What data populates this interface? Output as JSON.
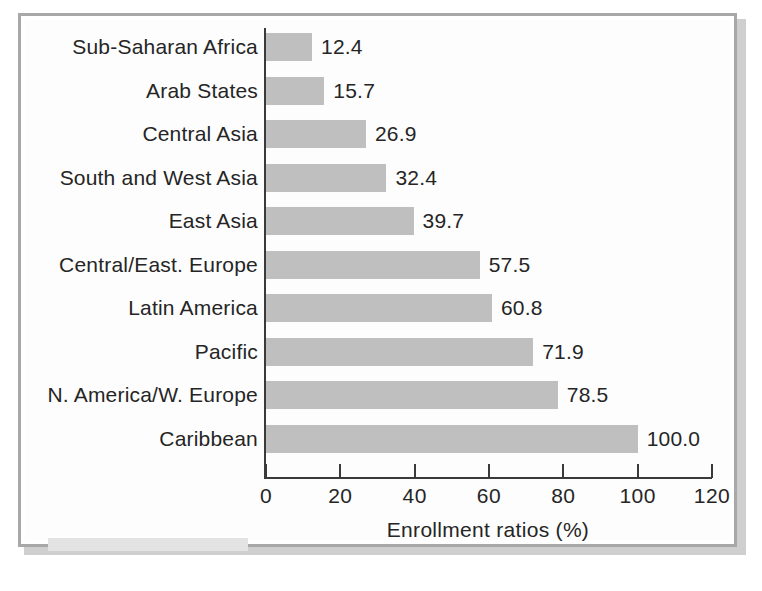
{
  "figure": {
    "frame_color": "#a8a8a8",
    "bar_color": "#bfbfbf",
    "text_color": "#252525"
  },
  "chart_data": {
    "type": "bar",
    "orientation": "horizontal",
    "title": "",
    "subtitle": "",
    "xlabel": "Enrollment ratios (%)",
    "ylabel": "",
    "xlim": [
      0,
      120
    ],
    "xticks": [
      0,
      20,
      40,
      60,
      80,
      100,
      120
    ],
    "xtick_labels": [
      "0",
      "20",
      "40",
      "60",
      "80",
      "100",
      "120"
    ],
    "grid": false,
    "legend": false,
    "value_labels": true,
    "categories": [
      "Sub-Saharan Africa",
      "Arab States",
      "Central Asia",
      "South and West Asia",
      "East Asia",
      "Central/East. Europe",
      "Latin America",
      "Pacific",
      "N. America/W. Europe",
      "Caribbean"
    ],
    "values": [
      12.4,
      15.7,
      26.9,
      32.4,
      39.7,
      57.5,
      60.8,
      71.9,
      78.5,
      100.0
    ],
    "value_label_text": [
      "12.4",
      "15.7",
      "26.9",
      "32.4",
      "39.7",
      "57.5",
      "60.8",
      "71.9",
      "78.5",
      "100.0"
    ]
  }
}
